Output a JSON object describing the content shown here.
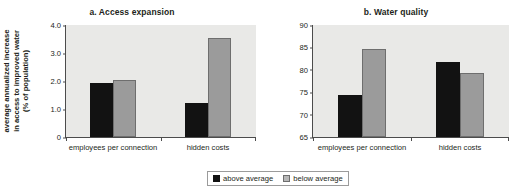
{
  "legend": {
    "position": "bottom-center",
    "entries": [
      {
        "label": "above average",
        "color": "#121212",
        "key": "above"
      },
      {
        "label": "below average",
        "color": "#9b9b9b",
        "key": "below"
      }
    ]
  },
  "colors": {
    "above_average": "#121212",
    "below_average": "#9b9b9b",
    "plot_background": "#e9e9e7",
    "axis": "#4c4c4c",
    "text": "#231f20"
  },
  "chart_data": [
    {
      "type": "bar",
      "id": "a",
      "title": "a. Access expansion",
      "xlabel": "",
      "ylabel": "average annualized increase\nin access to improved water\n(% of population)",
      "ylim": [
        0,
        4.0
      ],
      "yticks": [
        "0",
        "1.0",
        "2.0",
        "3.0",
        "4.0"
      ],
      "ytick_values": [
        0,
        1.0,
        2.0,
        3.0,
        4.0
      ],
      "grid": false,
      "categories": [
        "employees per connection",
        "hidden costs"
      ],
      "series": [
        {
          "name": "above average",
          "values": [
            1.93,
            1.2
          ]
        },
        {
          "name": "below average",
          "values": [
            2.04,
            3.55
          ]
        }
      ]
    },
    {
      "type": "bar",
      "id": "b",
      "title": "b. Water quality",
      "xlabel": "",
      "ylabel": "% of sample passing\nchlorine test",
      "ylim": [
        65,
        90
      ],
      "yticks": [
        "65",
        "70",
        "75",
        "80",
        "85",
        "90"
      ],
      "ytick_values": [
        65,
        70,
        75,
        80,
        85,
        90
      ],
      "grid": false,
      "categories": [
        "employees per connection",
        "hidden costs"
      ],
      "series": [
        {
          "name": "above average",
          "values": [
            74.3,
            81.8
          ]
        },
        {
          "name": "below average",
          "values": [
            84.7,
            79.3
          ]
        }
      ]
    }
  ]
}
